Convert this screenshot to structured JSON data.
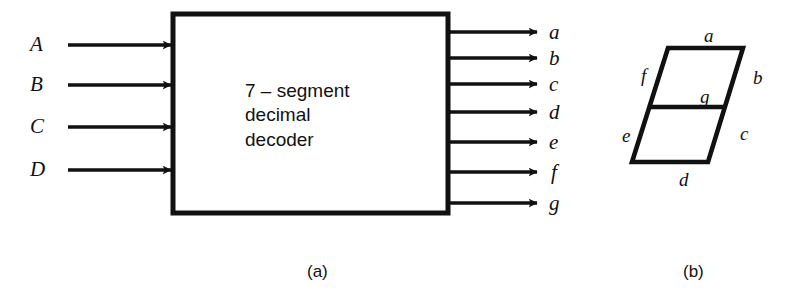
{
  "figure": {
    "background_color": "#ffffff",
    "ink_color": "#111111",
    "panel_a": {
      "block_label_lines": [
        "7 – segment",
        "decimal",
        "decoder"
      ],
      "caption": "(a)",
      "inputs": [
        {
          "label": "A",
          "y": 45
        },
        {
          "label": "B",
          "y": 85
        },
        {
          "label": "C",
          "y": 127
        },
        {
          "label": "D",
          "y": 170
        }
      ],
      "outputs": [
        {
          "label": "a",
          "y": 32
        },
        {
          "label": "b",
          "y": 58
        },
        {
          "label": "c",
          "y": 84
        },
        {
          "label": "d",
          "y": 112
        },
        {
          "label": "e",
          "y": 142
        },
        {
          "label": "f",
          "y": 172
        },
        {
          "label": "g",
          "y": 203
        }
      ]
    },
    "panel_b": {
      "caption": "(b)",
      "segments": [
        {
          "label": "a",
          "position": "top"
        },
        {
          "label": "b",
          "position": "upper-right"
        },
        {
          "label": "c",
          "position": "lower-right"
        },
        {
          "label": "d",
          "position": "bottom"
        },
        {
          "label": "e",
          "position": "lower-left"
        },
        {
          "label": "f",
          "position": "upper-left"
        },
        {
          "label": "g",
          "position": "middle"
        }
      ]
    }
  }
}
